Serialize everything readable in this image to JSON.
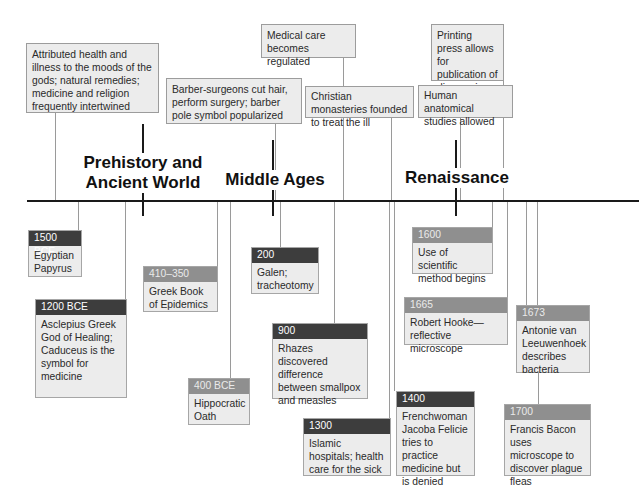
{
  "eras": [
    {
      "label_line1": "Prehistory and",
      "label_line2": "Ancient World"
    },
    {
      "label_line1": "Middle Ages"
    },
    {
      "label_line1": "Renaissance"
    }
  ],
  "top_notes": [
    {
      "text": "Attributed health and illness to the moods of the gods; natural remedies; medicine and religion frequently intertwined"
    },
    {
      "text": "Barber-surgeons cut hair, perform surgery; barber pole symbol popularized"
    },
    {
      "text": "Medical care becomes regulated"
    },
    {
      "text": "Christian monasteries founded to treat the ill"
    },
    {
      "text": "Printing press allows for publication of discoveries"
    },
    {
      "text": "Human anatomical studies allowed"
    }
  ],
  "events": [
    {
      "date": "1500 BCE",
      "text": "Egyptian Papyrus",
      "header_style": "dark"
    },
    {
      "date": "1200 BCE",
      "text": "Asclepius Greek God of Healing; Caduceus is the symbol for medicine",
      "header_style": "dark"
    },
    {
      "date": "410–350 BCE",
      "text": "Greek Book of Epidemics",
      "header_style": "mid"
    },
    {
      "date": "400 BCE",
      "text": "Hippocratic Oath",
      "header_style": "mid"
    },
    {
      "date": "200",
      "text": "Galen; tracheotomy",
      "header_style": "dark"
    },
    {
      "date": "900",
      "text": "Rhazes discovered difference between smallpox and measles",
      "header_style": "dark"
    },
    {
      "date": "1300",
      "text": "Islamic hospitals; health care for the sick",
      "header_style": "dark"
    },
    {
      "date": "1400",
      "text": "Frenchwoman Jacoba Felicie tries to practice medicine but is denied",
      "header_style": "dark"
    },
    {
      "date": "1600",
      "text": "Use of scientific method begins",
      "header_style": "mid"
    },
    {
      "date": "1665",
      "text": "Robert Hooke—reflective microscope",
      "header_style": "mid"
    },
    {
      "date": "1673",
      "text": "Antonie van Leeuwenhoek describes bacteria",
      "header_style": "mid"
    },
    {
      "date": "1700",
      "text": "Francis Bacon uses microscope to discover plague fleas",
      "header_style": "mid"
    }
  ],
  "colors": {
    "axis": "#1a1a1a",
    "box_fill": "#ececec",
    "header_dark": "#3d3d3d",
    "header_mid": "#8f8f8f",
    "connector": "#9a9a9a"
  }
}
